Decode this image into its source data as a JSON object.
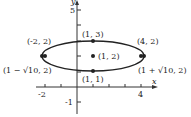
{
  "diagram": {
    "type": "ellipse-graph",
    "axes": {
      "x_label": "x",
      "y_label": "y",
      "x_ticks": [
        "-2",
        "4"
      ],
      "y_ticks": [
        "5",
        "-1"
      ]
    },
    "center": {
      "label": "(1, 2)"
    },
    "vertices_minor": [
      {
        "label": "(1, 3)"
      },
      {
        "label": "(1, 1)"
      }
    ],
    "foci": [
      {
        "label": "(-2, 2)"
      },
      {
        "label": "(4, 2)"
      }
    ],
    "vertices_major": [
      {
        "label": "(1 − √10, 2)"
      },
      {
        "label": "(1 + √10, 2)"
      }
    ]
  }
}
